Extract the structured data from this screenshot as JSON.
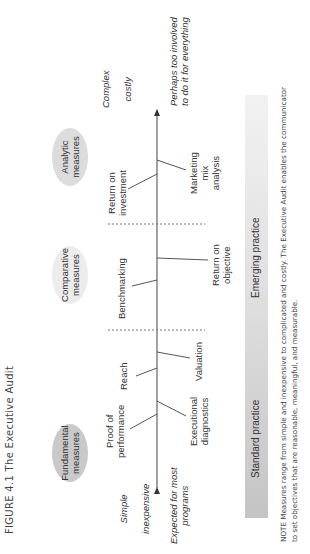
{
  "figure": {
    "title": "FIGURE 4.1  The Executive Audit",
    "orientation": "rotated-90-ccw"
  },
  "categories": [
    {
      "label_line1": "Fundamental",
      "label_line2": "measures",
      "fill": "#c9c9c9"
    },
    {
      "label_line1": "Comparative",
      "label_line2": "measures",
      "fill": "#ececec"
    },
    {
      "label_line1": "Analytic",
      "label_line2": "measures",
      "fill": "#dcdcdc"
    }
  ],
  "axis": {
    "left_end": {
      "line1": "Simple",
      "line2": "inexpensive"
    },
    "right_end": {
      "line1": "Complex",
      "line2": "costly"
    },
    "left_note": {
      "line1": "Expected for most",
      "line2": "programs"
    },
    "right_note": {
      "line1": "Perhaps too involved",
      "line2": "to do it for everything"
    }
  },
  "measures_above": [
    {
      "line1": "Proof of",
      "line2": "performance"
    },
    {
      "line1": "Reach",
      "line2": ""
    },
    {
      "line1": "Benchmarking",
      "line2": ""
    },
    {
      "line1": "Return on",
      "line2": "investment"
    }
  ],
  "measures_below": [
    {
      "line1": "Executional",
      "line2": "diagnostics"
    },
    {
      "line1": "Valuation",
      "line2": ""
    },
    {
      "line1": "Return on",
      "line2": "objective"
    },
    {
      "line1": "Marketing",
      "line2": "mix",
      "line3": "analysis"
    }
  ],
  "practice_bar": {
    "left_label": "Standard practice",
    "right_label": "Emerging practice",
    "color_start": "#c4c4c4",
    "color_end": "#f2f2f2"
  },
  "note": {
    "line1": "NOTE  Measures range from simple and inexpensive to complicated and costly. The Executive Audit enables the communicator",
    "line2": "to set objectives that are reasonable, meaningful, and measurable."
  }
}
